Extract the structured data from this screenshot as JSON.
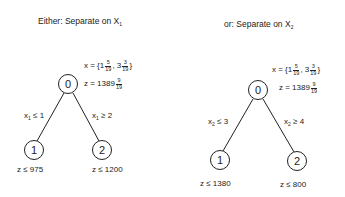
{
  "left_tree": {
    "title": "Either: Separate on X",
    "title_sub": "1",
    "root": {
      "label": "0",
      "x_prefix": "x = {1",
      "x_frac1_num": "5",
      "x_frac1_den": "19",
      "x_mid": ", 3",
      "x_frac2_num": "3",
      "x_frac2_den": "19",
      "x_suffix": "}",
      "z_prefix": "z = 1389",
      "z_frac_num": "9",
      "z_frac_den": "19"
    },
    "branch_left": {
      "var": "x",
      "sub": "1",
      "cond": "≤ 1"
    },
    "branch_right": {
      "var": "x",
      "sub": "1",
      "cond": "≥ 2"
    },
    "child1": {
      "label": "1",
      "bound": "z  ≤  975"
    },
    "child2": {
      "label": "2",
      "bound": "z  ≤ 1200"
    }
  },
  "right_tree": {
    "title": "or: Separate on X",
    "title_sub": "2",
    "root": {
      "label": "0",
      "x_prefix": "x = {1",
      "x_frac1_num": "5",
      "x_frac1_den": "19",
      "x_mid": ", 3",
      "x_frac2_num": "3",
      "x_frac2_den": "19",
      "x_suffix": "}",
      "z_prefix": "z = 1389",
      "z_frac_num": "9",
      "z_frac_den": "19"
    },
    "branch_left": {
      "var": "x",
      "sub": "2",
      "cond": "≤ 3"
    },
    "branch_right": {
      "var": "x",
      "sub": "2",
      "cond": "≥ 4"
    },
    "child1": {
      "label": "1",
      "bound": "z  ≤ 1380"
    },
    "child2": {
      "label": "2",
      "bound": "z  ≤ 800"
    }
  }
}
